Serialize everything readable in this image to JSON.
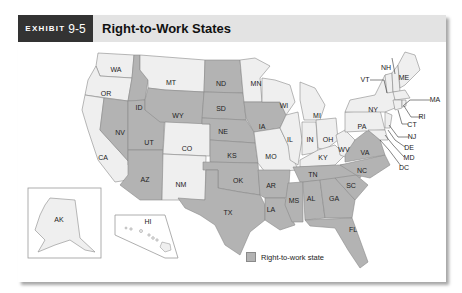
{
  "header": {
    "exhibit_label": "EXHIBIT",
    "exhibit_number": "9-5",
    "title": "Right-to-Work States"
  },
  "legend": {
    "label": "Right-to-work state",
    "swatch_color": "#b3b3b3"
  },
  "colors": {
    "right_to_work": "#b3b3b3",
    "other": "#efefef",
    "border": "#8a8a8a",
    "header_bg": "#e3e3e3",
    "exhibit_bg": "#333333"
  },
  "map": {
    "right_to_work_states": [
      "ID",
      "NV",
      "UT",
      "AZ",
      "WY",
      "ND",
      "SD",
      "NE",
      "KS",
      "OK",
      "TX",
      "IA",
      "AR",
      "LA",
      "MS",
      "AL",
      "TN",
      "GA",
      "SC",
      "NC",
      "VA",
      "FL"
    ],
    "other_states": [
      "WA",
      "OR",
      "CA",
      "MT",
      "CO",
      "NM",
      "MN",
      "WI",
      "IL",
      "MO",
      "MI",
      "IN",
      "OH",
      "KY",
      "WV",
      "PA",
      "NY",
      "VT",
      "NH",
      "ME",
      "MA",
      "RI",
      "CT",
      "NJ",
      "DE",
      "MD",
      "DC",
      "AK",
      "HI"
    ],
    "labels": {
      "WA": "WA",
      "OR": "OR",
      "CA": "CA",
      "ID": "ID",
      "NV": "NV",
      "UT": "UT",
      "AZ": "AZ",
      "MT": "MT",
      "WY": "WY",
      "CO": "CO",
      "NM": "NM",
      "ND": "ND",
      "SD": "SD",
      "NE": "NE",
      "KS": "KS",
      "OK": "OK",
      "TX": "TX",
      "MN": "MN",
      "IA": "IA",
      "MO": "MO",
      "AR": "AR",
      "LA": "LA",
      "WI": "WI",
      "IL": "IL",
      "MI": "MI",
      "IN": "IN",
      "OH": "OH",
      "KY": "KY",
      "TN": "TN",
      "MS": "MS",
      "AL": "AL",
      "GA": "GA",
      "FL": "FL",
      "SC": "SC",
      "NC": "NC",
      "VA": "VA",
      "WV": "WV",
      "PA": "PA",
      "NY": "NY",
      "VT": "VT",
      "NH": "NH",
      "ME": "ME",
      "MA": "MA",
      "RI": "RI",
      "CT": "CT",
      "NJ": "NJ",
      "DE": "DE",
      "MD": "MD",
      "DC": "DC",
      "AK": "AK",
      "HI": "HI"
    }
  }
}
